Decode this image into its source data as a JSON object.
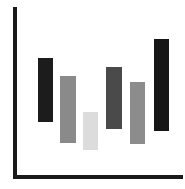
{
  "chart_data": {
    "type": "bar",
    "subtype": "floating-range",
    "title": "",
    "xlabel": "",
    "ylabel": "",
    "grid": false,
    "legend": null,
    "categories": [
      "1",
      "2",
      "3",
      "4",
      "5",
      "6"
    ],
    "series": [
      {
        "name": "range",
        "low": [
          0.34,
          0.21,
          0.17,
          0.3,
          0.21,
          0.29
        ],
        "high": [
          0.71,
          0.6,
          0.38,
          0.66,
          0.56,
          0.82
        ]
      }
    ],
    "ylim": [
      0,
      1
    ],
    "colors": [
      "#1c1c1c",
      "#8a8a8a",
      "#dcdcdc",
      "#4a4a4a",
      "#8c8c8c",
      "#161616"
    ]
  },
  "layout": {
    "bars": [
      {
        "left": 38,
        "top": 58,
        "width": 15,
        "height": 64,
        "color": "#1c1c1c"
      },
      {
        "left": 60,
        "top": 76,
        "width": 16,
        "height": 67,
        "color": "#8a8a8a"
      },
      {
        "left": 83,
        "top": 112,
        "width": 15,
        "height": 38,
        "color": "#dcdcdc"
      },
      {
        "left": 106,
        "top": 67,
        "width": 16,
        "height": 62,
        "color": "#4a4a4a"
      },
      {
        "left": 130,
        "top": 82,
        "width": 15,
        "height": 62,
        "color": "#8c8c8c"
      },
      {
        "left": 154,
        "top": 39,
        "width": 15,
        "height": 92,
        "color": "#161616"
      }
    ]
  }
}
